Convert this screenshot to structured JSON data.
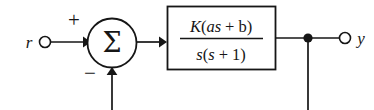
{
  "diagram": {
    "type": "control-system-block-diagram",
    "colors": {
      "background": "#ffffff",
      "ink": "#161616",
      "block_fill": "#ffffff"
    },
    "input": {
      "label": "r",
      "terminal": "open-circle"
    },
    "output": {
      "label": "y",
      "terminal": "open-circle"
    },
    "summing_junction": {
      "glyph": "Σ",
      "shape": "circle",
      "signs": {
        "reference_input": "+",
        "feedback_input": "−"
      }
    },
    "block": {
      "transfer_function": {
        "numerator": "K(as + b)",
        "denominator": "s(s + 1)",
        "numerator_parts": {
          "gain": "K",
          "open_paren": "(",
          "zero_term": "as",
          "plus": "+",
          "constant": "b",
          "close_paren": ")"
        },
        "denominator_parts": {
          "pole_s": "s",
          "open_paren": "(",
          "inner_s": "s",
          "plus": "+",
          "one": "1",
          "close_paren": ")"
        }
      }
    },
    "takeoff_point": {
      "marker": "filled-dot",
      "note": "output tapped for feedback path"
    },
    "signal_flow": [
      "r",
      "summing-junction",
      "K(as + b) / s(s + 1)",
      "y"
    ]
  }
}
